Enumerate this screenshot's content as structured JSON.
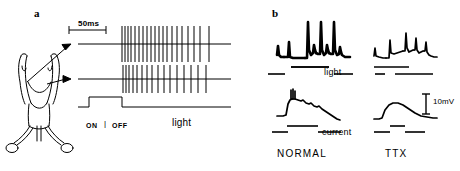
{
  "figure": {
    "panel_a": {
      "label": "a",
      "scale_bar_label": "50ms",
      "stimulus_on_label": "ON",
      "stimulus_separator": "|",
      "stimulus_off_label": "OFF",
      "stimulus_name": "light",
      "preparation_diagram_name": "dissected-animal-preparation",
      "recordings": [
        {
          "name": "extracellular-spike-train-upper",
          "baseline_y": 44,
          "x_start": 78,
          "x_end": 231,
          "spike_up": 18,
          "spike_down": 18,
          "spike_times": [
            122,
            125,
            128,
            131,
            135,
            139,
            143,
            147,
            151,
            155,
            159,
            163,
            167,
            172,
            177,
            182,
            188,
            194,
            200,
            209
          ]
        },
        {
          "name": "extracellular-spike-train-lower",
          "baseline_y": 79,
          "x_start": 78,
          "x_end": 231,
          "spike_up": 14,
          "spike_down": 14,
          "spike_times": [
            123,
            126,
            129,
            133,
            137,
            142,
            147,
            152,
            158,
            164,
            170,
            177,
            184,
            191,
            198,
            206
          ]
        }
      ],
      "stimulus_trace": {
        "name": "light-stimulus-step",
        "baseline_y": 107,
        "high_y": 97,
        "x_start": 78,
        "x_on": 89,
        "x_off": 122,
        "x_end": 231
      },
      "scale_bar": {
        "x_start": 69,
        "x_end": 106,
        "y": 30
      },
      "arrows": [
        {
          "name": "arrow-to-upper-trace",
          "x1": 27,
          "y1": 82,
          "x2": 71,
          "y2": 44
        },
        {
          "name": "arrow-to-lower-trace",
          "x1": 47,
          "y1": 84,
          "x2": 71,
          "y2": 79
        }
      ]
    },
    "panel_b": {
      "label": "b",
      "row_light_label": "light",
      "row_current_label": "current",
      "scale_label": "10mV",
      "column_labels": [
        "NORMAL",
        "TTX"
      ],
      "traces": [
        {
          "name": "normal-light-response",
          "condition": "NORMAL",
          "stimulus": "light",
          "spikes": 3,
          "has_action_potentials": true
        },
        {
          "name": "ttx-light-response",
          "condition": "TTX",
          "stimulus": "light",
          "spikes": 0,
          "has_action_potentials": false
        },
        {
          "name": "normal-current-response",
          "condition": "NORMAL",
          "stimulus": "current",
          "spikes": 3,
          "has_action_potentials": true
        },
        {
          "name": "ttx-current-response",
          "condition": "TTX",
          "stimulus": "current",
          "spikes": 0,
          "has_action_potentials": false
        }
      ],
      "stimulus_bars": {
        "light_row_normal": [
          [
            268,
            285
          ],
          [
            291,
            329
          ],
          [
            334,
            353
          ]
        ],
        "light_row_ttx": [
          [
            375,
            385
          ],
          [
            395,
            433
          ]
        ],
        "current_row_normal": [
          [
            272,
            288
          ],
          [
            318,
            341
          ]
        ],
        "current_row_ttx": [
          [
            374,
            390
          ],
          [
            405,
            425
          ]
        ]
      }
    }
  }
}
